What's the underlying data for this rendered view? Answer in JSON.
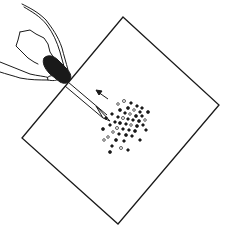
{
  "figure": {
    "colors": {
      "ink": "#1a1a1a",
      "paper": "#ffffff"
    },
    "elements": {
      "sheet": "square sheet",
      "hand": "hand",
      "pipette": "pipette",
      "bulb": "pipette bulb",
      "arrow": "direction arrow",
      "drops": "drops"
    }
  }
}
